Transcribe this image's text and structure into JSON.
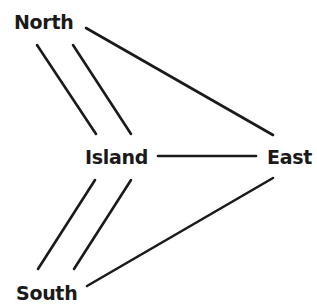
{
  "diagram": {
    "type": "graph",
    "nodes": [
      {
        "id": "north",
        "label": "North"
      },
      {
        "id": "island",
        "label": "Island"
      },
      {
        "id": "east",
        "label": "East"
      },
      {
        "id": "south",
        "label": "South"
      }
    ],
    "edges": [
      {
        "from": "north",
        "to": "island",
        "index": 1
      },
      {
        "from": "north",
        "to": "island",
        "index": 2
      },
      {
        "from": "north",
        "to": "east"
      },
      {
        "from": "island",
        "to": "east"
      },
      {
        "from": "island",
        "to": "south",
        "index": 1
      },
      {
        "from": "island",
        "to": "south",
        "index": 2
      },
      {
        "from": "south",
        "to": "east"
      }
    ],
    "colors": {
      "line": "#1a1a1a",
      "text": "#1a1a1a",
      "background": "#ffffff"
    }
  }
}
